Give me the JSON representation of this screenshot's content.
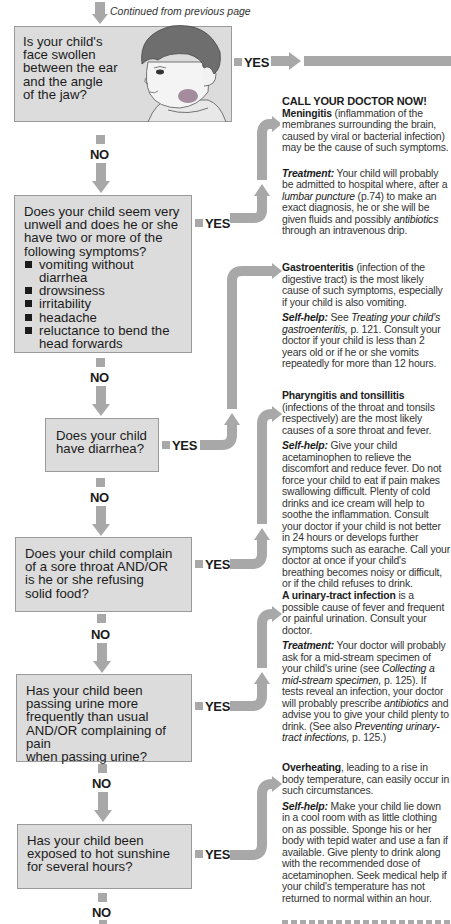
{
  "header": {
    "continued_label": "Continued from previous page"
  },
  "flowchart": {
    "no_label": "NO",
    "yes_label": "YES",
    "questions": [
      {
        "id": "q1",
        "text": "Is your child's face swollen between the ear and the angle of the jaw?",
        "lines": [
          "Is your child's",
          "face swollen",
          "between the ear",
          "and the angle",
          "of the jaw?"
        ],
        "illustration": "child-with-swollen-jaw"
      },
      {
        "id": "q2",
        "lines": [
          "Does your child seem very",
          "unwell and does he or she",
          "have two or more of the",
          "following symptoms?"
        ],
        "bullets": [
          "vomiting without diarrhea",
          "drowsiness",
          "irritability",
          "headache",
          "reluctance to bend the head forwards"
        ],
        "bullet_lines": [
          [
            "vomiting without",
            "diarrhea"
          ],
          [
            "drowsiness"
          ],
          [
            "irritability"
          ],
          [
            "headache"
          ],
          [
            "reluctance to bend the",
            "head forwards"
          ]
        ]
      },
      {
        "id": "q3",
        "lines": [
          "Does your child",
          "have diarrhea?"
        ]
      },
      {
        "id": "q4",
        "lines": [
          "Does your child complain",
          "of a sore throat AND/OR",
          "is he or she refusing",
          "solid food?"
        ]
      },
      {
        "id": "q5",
        "lines": [
          "Has your child been",
          "passing urine more",
          "frequently than usual",
          "AND/OR complaining of pain",
          "when passing urine?"
        ]
      },
      {
        "id": "q6",
        "lines": [
          "Has your child been",
          "exposed to hot sunshine",
          "for several hours?"
        ]
      }
    ]
  },
  "answers": {
    "a2": {
      "call_now": "CALL YOUR DOCTOR NOW!",
      "condition": "Meningitis",
      "condition_desc": " (inflammation of the membranes surrounding the brain, caused by viral or bacterial infection) may be the cause of such symptoms.",
      "treatment_label": "Treatment:",
      "treatment_1": " Your child will probably be admitted to hospital where, after a ",
      "treatment_link_1": "lumbar puncture",
      "treatment_2": " (p.74) to make an exact diagnosis, he or she will be given fluids and possibly ",
      "treatment_link_2": "antibiotics",
      "treatment_3": " through an intravenous drip."
    },
    "a3": {
      "condition": "Gastroenteritis",
      "condition_desc": " (infection of the digestive tract) is the most likely cause of such symptoms, especially if your child is also vomiting.",
      "selfhelp_label": "Self-help:",
      "selfhelp_1": " See ",
      "selfhelp_link_1": "Treating your child's gastroenteritis,",
      "selfhelp_2": " p. 121. Consult your doctor if your child is less than 2 years old or if he or she vomits repeatedly for more than 12 hours."
    },
    "a4": {
      "condition": "Pharyngitis and tonsillitis",
      "condition_desc": "(infections of the throat and tonsils respectively) are the most likely causes of a sore throat and fever.",
      "selfhelp_label": "Self-help:",
      "selfhelp_1": " Give your child acetaminophen to relieve the discomfort and reduce fever. Do not force your child to eat if pain makes swallowing difficult. Plenty of cold drinks and ice cream will help to soothe the inflammation. Consult your doctor if your child is not better in 24 hours or develops further symptoms such as earache. Call your doctor at once if your child's breathing becomes noisy or difficult, or if the child refuses to drink."
    },
    "a5": {
      "condition": "A urinary-tract infection",
      "condition_desc": " is a possible cause of fever and frequent or painful urination. Consult your doctor.",
      "treatment_label": "Treatment:",
      "treatment_1": " Your doctor will probably ask for a mid-stream specimen of your child's urine (see ",
      "treatment_link_1": "Collecting a mid-stream specimen,",
      "treatment_2": " p. 125). If tests reveal an infection, your doctor will probably prescribe ",
      "treatment_link_2": "antibiotics",
      "treatment_3": " and advise you to give your child plenty to drink. (See also ",
      "treatment_link_3": "Preventing urinary-tract infections,",
      "treatment_4": " p. 125.)"
    },
    "a6": {
      "condition": "Overheating",
      "condition_desc": ", leading to a rise in body temperature, can easily occur in such circumstances.",
      "selfhelp_label": "Self-help:",
      "selfhelp_1": " Make your child lie down in a cool room with as little clothing on as possible. Sponge his or her body with tepid water and use a fan if available. Give plenty to drink along with the recommended dose of acetaminophen. Seek medical help if your child's temperature has not returned to normal within an hour."
    }
  },
  "colors": {
    "box_fill": "#dcdcdc",
    "box_border": "#9a9a9a",
    "arrow_gray": "#a8a8a8",
    "text": "#1b1b1b"
  }
}
